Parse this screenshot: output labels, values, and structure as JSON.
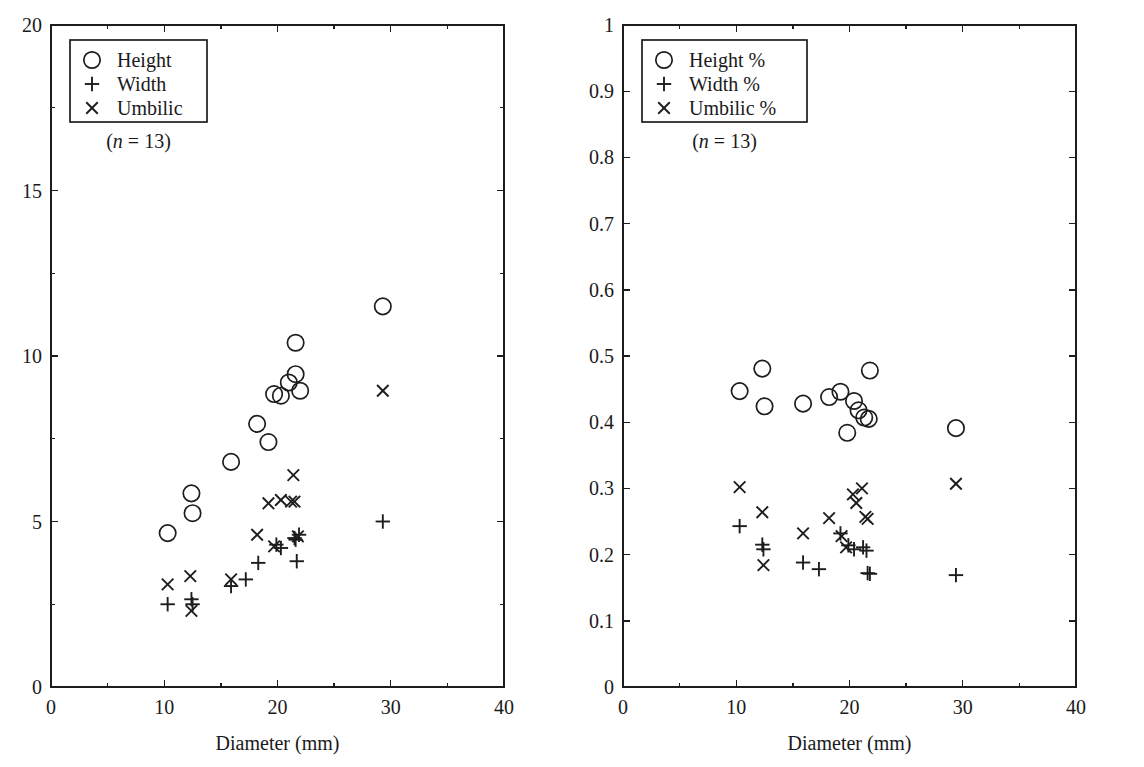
{
  "figure": {
    "background": "#ffffff",
    "ink_color": "#1d1d1d",
    "panels": [
      "left",
      "right"
    ]
  },
  "chart_data": [
    {
      "id": "left",
      "type": "scatter",
      "title": "",
      "xlabel": "Diameter (mm)",
      "ylabel": "",
      "xlim": [
        0,
        40
      ],
      "ylim": [
        0,
        20
      ],
      "xticks": [
        0,
        10,
        20,
        30,
        40
      ],
      "xticklabels": [
        "0",
        "10",
        "20",
        "30",
        "40"
      ],
      "yticks": [
        0,
        5,
        10,
        15,
        20
      ],
      "yticklabels": [
        "0",
        "5",
        "10",
        "15",
        "20"
      ],
      "xminorticks": [
        5,
        15,
        25,
        35
      ],
      "yminorticks": [
        2.5,
        7.5,
        12.5,
        17.5
      ],
      "grid": false,
      "legend_position": "upper left",
      "legend_entries": [
        {
          "marker": "circle",
          "label": "Height"
        },
        {
          "marker": "plus",
          "label": "Width"
        },
        {
          "marker": "cross",
          "label": "Umbilic"
        }
      ],
      "annotation": "(n = 13)",
      "annotation_italic_part": "n",
      "series": [
        {
          "name": "Height",
          "marker": "circle",
          "points": [
            [
              10.3,
              4.65
            ],
            [
              12.4,
              5.85
            ],
            [
              12.5,
              5.25
            ],
            [
              15.9,
              6.8
            ],
            [
              18.2,
              7.95
            ],
            [
              19.2,
              7.4
            ],
            [
              19.7,
              8.85
            ],
            [
              20.3,
              8.8
            ],
            [
              21.0,
              9.2
            ],
            [
              21.6,
              9.45
            ],
            [
              21.6,
              10.4
            ],
            [
              22.0,
              8.95
            ],
            [
              29.3,
              11.5
            ]
          ]
        },
        {
          "name": "Width",
          "marker": "plus",
          "points": [
            [
              10.3,
              2.5
            ],
            [
              12.4,
              2.65
            ],
            [
              12.5,
              2.5
            ],
            [
              15.9,
              3.05
            ],
            [
              17.2,
              3.25
            ],
            [
              18.3,
              3.75
            ],
            [
              19.9,
              4.3
            ],
            [
              20.3,
              4.2
            ],
            [
              21.5,
              4.5
            ],
            [
              21.6,
              4.45
            ],
            [
              21.7,
              3.8
            ],
            [
              21.9,
              4.6
            ],
            [
              29.3,
              5.0
            ]
          ]
        },
        {
          "name": "Umbilic",
          "marker": "cross",
          "points": [
            [
              10.3,
              3.1
            ],
            [
              12.3,
              3.35
            ],
            [
              12.4,
              2.3
            ],
            [
              15.9,
              3.25
            ],
            [
              18.2,
              4.6
            ],
            [
              19.2,
              5.55
            ],
            [
              19.7,
              4.25
            ],
            [
              20.3,
              5.65
            ],
            [
              21.2,
              5.6
            ],
            [
              21.4,
              6.4
            ],
            [
              21.5,
              5.6
            ],
            [
              21.8,
              4.55
            ],
            [
              29.3,
              8.95
            ]
          ]
        }
      ]
    },
    {
      "id": "right",
      "type": "scatter",
      "title": "",
      "xlabel": "Diameter (mm)",
      "ylabel": "",
      "xlim": [
        0,
        40
      ],
      "ylim": [
        0,
        1
      ],
      "xticks": [
        0,
        10,
        20,
        30,
        40
      ],
      "xticklabels": [
        "0",
        "10",
        "20",
        "30",
        "40"
      ],
      "yticks": [
        0,
        0.1,
        0.2,
        0.3,
        0.4,
        0.5,
        0.6,
        0.7,
        0.8,
        0.9,
        1
      ],
      "yticklabels": [
        "0",
        "0.1",
        "0.2",
        "0.3",
        "0.4",
        "0.5",
        "0.6",
        "0.7",
        "0.8",
        "0.9",
        "1"
      ],
      "xminorticks": [
        5,
        15,
        25,
        35
      ],
      "grid": false,
      "legend_position": "upper left",
      "legend_entries": [
        {
          "marker": "circle",
          "label": "Height %"
        },
        {
          "marker": "plus",
          "label": "Width %"
        },
        {
          "marker": "cross",
          "label": "Umbilic %"
        }
      ],
      "annotation": "(n = 13)",
      "annotation_italic_part": "n",
      "series": [
        {
          "name": "Height %",
          "marker": "circle",
          "points": [
            [
              10.3,
              0.447
            ],
            [
              12.3,
              0.481
            ],
            [
              12.5,
              0.424
            ],
            [
              15.9,
              0.428
            ],
            [
              18.2,
              0.438
            ],
            [
              19.2,
              0.446
            ],
            [
              19.8,
              0.384
            ],
            [
              20.4,
              0.432
            ],
            [
              20.8,
              0.418
            ],
            [
              21.3,
              0.407
            ],
            [
              21.7,
              0.405
            ],
            [
              21.8,
              0.478
            ],
            [
              29.4,
              0.391
            ]
          ]
        },
        {
          "name": "Width %",
          "marker": "plus",
          "points": [
            [
              10.3,
              0.243
            ],
            [
              12.3,
              0.215
            ],
            [
              12.4,
              0.208
            ],
            [
              15.9,
              0.188
            ],
            [
              17.3,
              0.178
            ],
            [
              19.2,
              0.232
            ],
            [
              19.9,
              0.214
            ],
            [
              20.4,
              0.208
            ],
            [
              21.2,
              0.211
            ],
            [
              21.5,
              0.206
            ],
            [
              21.6,
              0.172
            ],
            [
              21.8,
              0.171
            ],
            [
              29.4,
              0.169
            ]
          ]
        },
        {
          "name": "Umbilic %",
          "marker": "cross",
          "points": [
            [
              10.3,
              0.302
            ],
            [
              12.3,
              0.264
            ],
            [
              12.4,
              0.184
            ],
            [
              15.9,
              0.232
            ],
            [
              18.2,
              0.255
            ],
            [
              19.3,
              0.228
            ],
            [
              19.7,
              0.211
            ],
            [
              20.3,
              0.291
            ],
            [
              20.6,
              0.278
            ],
            [
              21.1,
              0.3
            ],
            [
              21.4,
              0.257
            ],
            [
              21.6,
              0.254
            ],
            [
              29.4,
              0.307
            ]
          ]
        }
      ]
    }
  ]
}
